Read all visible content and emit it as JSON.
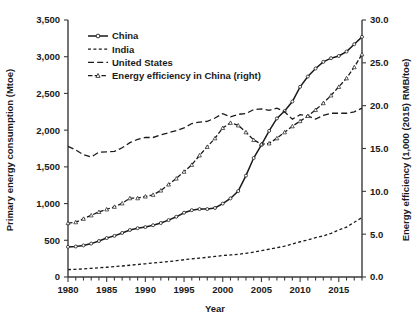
{
  "chart_data": {
    "type": "line",
    "title": "",
    "xlabel": "Year",
    "ylabel": "Primary energy consumption (Mtoe)",
    "y2label": "Energy efficiency (1,000 (2015) RMB/toe)",
    "xlim": [
      1980,
      2018
    ],
    "ylim": [
      0,
      3500
    ],
    "y2lim": [
      0.0,
      30.0
    ],
    "grid": false,
    "legend_position": "top-left",
    "xticks": [
      1980,
      1985,
      1990,
      1995,
      2000,
      2005,
      2010,
      2015
    ],
    "xtick_labels": [
      "1980",
      "1985",
      "1990",
      "1995",
      "2000",
      "2005",
      "2010",
      "2015"
    ],
    "xtick_minor_step": 1,
    "yticks": [
      0,
      500,
      1000,
      1500,
      2000,
      2500,
      3000,
      3500
    ],
    "ytick_labels": [
      "0",
      "500",
      "1,000",
      "1,500",
      "2,000",
      "2,500",
      "3,000",
      "3,500"
    ],
    "y2ticks": [
      0.0,
      5.0,
      10.0,
      15.0,
      20.0,
      25.0,
      30.0
    ],
    "y2tick_labels": [
      "0.0",
      "5.0",
      "10.0",
      "15.0",
      "20.0",
      "25.0",
      "30.0"
    ],
    "x": [
      1980,
      1981,
      1982,
      1983,
      1984,
      1985,
      1986,
      1987,
      1988,
      1989,
      1990,
      1991,
      1992,
      1993,
      1994,
      1995,
      1996,
      1997,
      1998,
      1999,
      2000,
      2001,
      2002,
      2003,
      2004,
      2005,
      2006,
      2007,
      2008,
      2009,
      2010,
      2011,
      2012,
      2013,
      2014,
      2015,
      2016,
      2017,
      2018
    ],
    "series": [
      {
        "name": "China",
        "axis": "left",
        "units": "Mtoe",
        "line_style": "solid",
        "marker": "circle",
        "color": "#1a1a1a",
        "values": [
          410,
          415,
          430,
          455,
          490,
          530,
          560,
          600,
          640,
          665,
          680,
          705,
          735,
          775,
          820,
          875,
          910,
          925,
          925,
          940,
          1000,
          1070,
          1170,
          1380,
          1620,
          1800,
          1990,
          2160,
          2260,
          2390,
          2590,
          2730,
          2840,
          2930,
          2980,
          3010,
          3070,
          3170,
          3270
        ]
      },
      {
        "name": "India",
        "axis": "left",
        "units": "Mtoe",
        "line_style": "dashed-short",
        "marker": "none",
        "color": "#1a1a1a",
        "values": [
          100,
          105,
          110,
          118,
          125,
          133,
          141,
          150,
          160,
          170,
          180,
          190,
          200,
          210,
          222,
          235,
          248,
          258,
          268,
          280,
          292,
          300,
          310,
          322,
          340,
          358,
          378,
          400,
          420,
          450,
          480,
          505,
          535,
          560,
          595,
          640,
          680,
          745,
          810
        ]
      },
      {
        "name": "United States",
        "axis": "left",
        "units": "Mtoe",
        "line_style": "dashed-long",
        "marker": "none",
        "color": "#1a1a1a",
        "values": [
          1780,
          1730,
          1665,
          1635,
          1700,
          1705,
          1710,
          1760,
          1830,
          1875,
          1900,
          1900,
          1935,
          1965,
          1995,
          2030,
          2090,
          2110,
          2120,
          2165,
          2225,
          2180,
          2215,
          2225,
          2280,
          2290,
          2270,
          2300,
          2250,
          2150,
          2210,
          2195,
          2150,
          2200,
          2230,
          2230,
          2230,
          2250,
          2300
        ]
      },
      {
        "name": "Energy efficiency in China (right)",
        "axis": "right",
        "units": "1,000 (2015) RMB/toe",
        "line_style": "dash-dot",
        "marker": "triangle",
        "color": "#1a1a1a",
        "values": [
          6.3,
          6.4,
          6.8,
          7.2,
          7.6,
          7.9,
          8.2,
          8.6,
          9.2,
          9.2,
          9.4,
          9.6,
          10.1,
          10.8,
          11.5,
          12.3,
          13.1,
          14.2,
          15.2,
          16.2,
          17.4,
          18.0,
          17.7,
          16.9,
          16.0,
          15.5,
          15.6,
          16.2,
          16.9,
          17.6,
          18.2,
          18.8,
          19.5,
          20.3,
          21.2,
          22.2,
          23.2,
          24.5,
          26.0
        ]
      }
    ]
  },
  "legend": {
    "items": [
      {
        "label": "China"
      },
      {
        "label": "India"
      },
      {
        "label": "United States"
      },
      {
        "label": "Energy efficiency in China (right)"
      }
    ]
  }
}
